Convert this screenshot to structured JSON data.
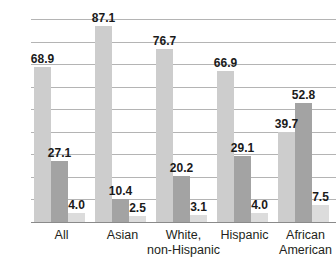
{
  "chart_data": {
    "type": "bar",
    "title": "",
    "subtitle": "",
    "xlabel": "",
    "ylabel": "",
    "ylim": [
      0,
      90
    ],
    "yticks": [
      0,
      10,
      20,
      30,
      40,
      50,
      60,
      70,
      80,
      90
    ],
    "grid": true,
    "legend": "none",
    "categories": [
      "All",
      "Asian",
      "White,\nnon-Hispanic",
      "Hispanic",
      "African\nAmerican"
    ],
    "series": [
      {
        "name": "series-1",
        "color": "#cdcdcd",
        "values": [
          68.9,
          87.1,
          76.7,
          66.9,
          39.7
        ]
      },
      {
        "name": "series-2",
        "color": "#a3a3a3",
        "values": [
          27.1,
          10.4,
          20.2,
          29.1,
          52.8
        ]
      },
      {
        "name": "series-3",
        "color": "#dcdcdc",
        "values": [
          4.0,
          2.5,
          3.1,
          4.0,
          7.5
        ]
      }
    ],
    "value_labels": [
      [
        "68.9",
        "87.1",
        "76.7",
        "66.9",
        "39.7"
      ],
      [
        "27.1",
        "10.4",
        "20.2",
        "29.1",
        "52.8"
      ],
      [
        "4.0",
        "2.5",
        "3.1",
        "4.0",
        "7.5"
      ]
    ],
    "ytick_labels": [
      "0",
      "10",
      "20",
      "30",
      "40",
      "50",
      "60",
      "70",
      "80",
      "90"
    ]
  }
}
